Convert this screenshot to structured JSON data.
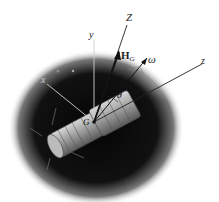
{
  "figure": {
    "colors": {
      "background": "#ffffff",
      "space": "#0a0a0a",
      "body": "#9a9a9a",
      "lines": "#1a1a1a",
      "axis_light": "#cccccc"
    },
    "labels": {
      "Z": "Z",
      "y": "y",
      "x": "x",
      "z": "z",
      "H": "H",
      "H_sub": "G",
      "omega": "ω",
      "theta": "θ",
      "G": "G"
    },
    "vectors": [
      {
        "name": "H_G",
        "label": "Angular momentum H_G (along Z)"
      },
      {
        "name": "omega",
        "label": "Angular velocity ω"
      }
    ],
    "axes": [
      "x",
      "y",
      "z",
      "Z"
    ],
    "angle": "θ between Z and z"
  }
}
